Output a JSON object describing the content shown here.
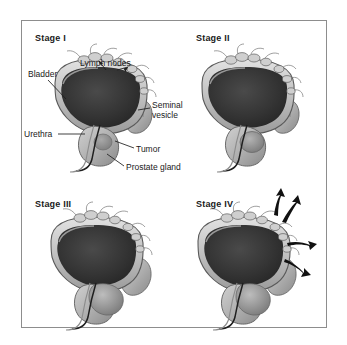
{
  "figure": {
    "background_color": "#ffffff",
    "frame_color": "#8d8d8d"
  },
  "palette": {
    "bladder_lumen": "#2f2f2f",
    "bladder_wall_light": "#d8d8d8",
    "bladder_wall_mid": "#a8a8a8",
    "organ_gray": "#b5b5b5",
    "tumor_gray": "#8f8f8f",
    "outline": "#4a4a4a",
    "arrow_black": "#111111",
    "text": "#1a1a1a"
  },
  "panels": [
    {
      "id": "stage-1",
      "stage_label": "Stage I",
      "callouts": [
        {
          "id": "bladder",
          "text": "Bladder"
        },
        {
          "id": "lymph-nodes",
          "text": "Lymph nodes"
        },
        {
          "id": "seminal-line-1",
          "text": "Seminal"
        },
        {
          "id": "seminal-line-2",
          "text": "vesicle"
        },
        {
          "id": "urethra",
          "text": "Urethra"
        },
        {
          "id": "tumor",
          "text": "Tumor"
        },
        {
          "id": "prostate-gland",
          "text": "Prostate gland"
        }
      ],
      "arrows": 0
    },
    {
      "id": "stage-2",
      "stage_label": "Stage II",
      "callouts": [],
      "arrows": 0
    },
    {
      "id": "stage-3",
      "stage_label": "Stage III",
      "callouts": [],
      "arrows": 0
    },
    {
      "id": "stage-4",
      "stage_label": "Stage IV",
      "callouts": [],
      "arrows": 4
    }
  ]
}
